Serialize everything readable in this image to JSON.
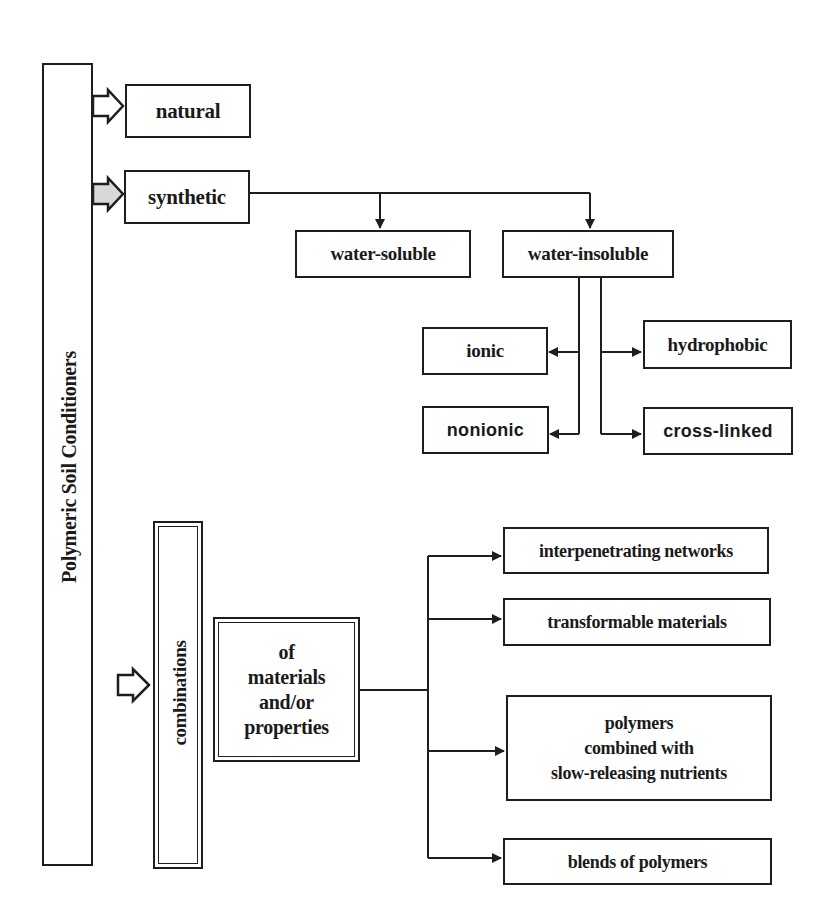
{
  "diagram": {
    "root": {
      "label": "Polymeric Soil Conditioners"
    },
    "categories": [
      {
        "id": "natural",
        "label": "natural"
      },
      {
        "id": "synthetic",
        "label": "synthetic"
      },
      {
        "id": "combinations",
        "label": "combinations"
      }
    ],
    "synthetic_children": [
      {
        "id": "water-soluble",
        "label": "water-soluble"
      },
      {
        "id": "water-insoluble",
        "label": "water-insoluble"
      }
    ],
    "water_insoluble_children": [
      {
        "id": "ionic",
        "label": "ionic"
      },
      {
        "id": "nonionic",
        "label": "nonionic"
      },
      {
        "id": "hydrophobic",
        "label": "hydrophobic"
      },
      {
        "id": "cross-linked",
        "label": "cross-linked"
      }
    ],
    "combinations_qualifier": {
      "lines": [
        "of",
        "materials",
        "and/or",
        "properties"
      ]
    },
    "combinations_children": [
      {
        "id": "interpenetrating-networks",
        "label": "interpenetrating networks"
      },
      {
        "id": "transformable-materials",
        "label": "transformable materials"
      },
      {
        "id": "polymers-nutrients",
        "lines": [
          "polymers",
          "combined with",
          "slow-releasing nutrients"
        ]
      },
      {
        "id": "blends-of-polymers",
        "label": "blends of polymers"
      }
    ],
    "colors": {
      "stroke": "#1e1e1e",
      "background": "#ffffff",
      "arrow_fill_synthetic": "#d8d8d8"
    }
  }
}
